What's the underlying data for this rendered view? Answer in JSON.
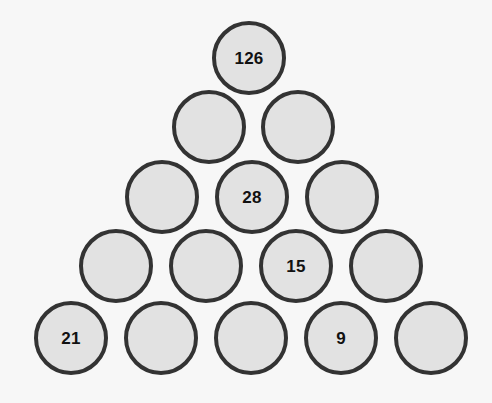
{
  "puzzle": {
    "type": "number-pyramid",
    "background_color": "#f7f7f7",
    "circle_fill_color": "#e2e2e2",
    "circle_border_color": "#333333",
    "label_color": "#111111",
    "rows": [
      {
        "row_index": 1,
        "center_y": 58,
        "cells": [
          {
            "index": 0,
            "value": "126",
            "center_x": 249,
            "filled": true
          }
        ]
      },
      {
        "row_index": 2,
        "center_y": 127,
        "cells": [
          {
            "index": 0,
            "value": "",
            "center_x": 209,
            "filled": false
          },
          {
            "index": 1,
            "value": "",
            "center_x": 298,
            "filled": false
          }
        ]
      },
      {
        "row_index": 3,
        "center_y": 197,
        "cells": [
          {
            "index": 0,
            "value": "",
            "center_x": 162,
            "filled": false
          },
          {
            "index": 1,
            "value": "28",
            "center_x": 252,
            "filled": true
          },
          {
            "index": 2,
            "value": "",
            "center_x": 342,
            "filled": false
          }
        ]
      },
      {
        "row_index": 4,
        "center_y": 266,
        "cells": [
          {
            "index": 0,
            "value": "",
            "center_x": 116,
            "filled": false
          },
          {
            "index": 1,
            "value": "",
            "center_x": 206,
            "filled": false
          },
          {
            "index": 2,
            "value": "15",
            "center_x": 296,
            "filled": true
          },
          {
            "index": 3,
            "value": "",
            "center_x": 386,
            "filled": false
          }
        ]
      },
      {
        "row_index": 5,
        "center_y": 338,
        "cells": [
          {
            "index": 0,
            "value": "21",
            "center_x": 71,
            "filled": true
          },
          {
            "index": 1,
            "value": "",
            "center_x": 161,
            "filled": false
          },
          {
            "index": 2,
            "value": "",
            "center_x": 251,
            "filled": false
          },
          {
            "index": 3,
            "value": "9",
            "center_x": 341,
            "filled": true
          },
          {
            "index": 4,
            "value": "",
            "center_x": 431,
            "filled": false
          }
        ]
      }
    ]
  }
}
